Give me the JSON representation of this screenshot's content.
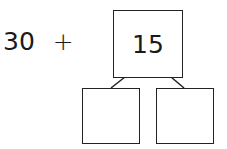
{
  "expression": {
    "number": "30",
    "operator": "+"
  },
  "number_bond": {
    "whole": "15",
    "parts": [
      "",
      ""
    ]
  }
}
